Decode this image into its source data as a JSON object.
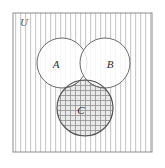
{
  "figure": {
    "type": "venn-diagram",
    "title": "",
    "universe": {
      "label": "U",
      "label_x": 20,
      "label_y": 26,
      "rect": {
        "x": 13,
        "y": 13,
        "width": 139,
        "height": 139
      },
      "border_color": "#8c8c8c",
      "fill_pattern": "vertical-hatch",
      "fill_color": "#ffffff",
      "hatch_color": "#c9c9c9",
      "hatch_spacing": 5
    },
    "sets": [
      {
        "name": "A",
        "label": "A",
        "cx": 62,
        "cy": 63,
        "r": 25,
        "label_x": 56,
        "label_y": 68,
        "stroke": "#6b6b6b",
        "fill": "#ffffff",
        "shaded": false
      },
      {
        "name": "B",
        "label": "B",
        "cx": 105,
        "cy": 63,
        "r": 25,
        "label_x": 110,
        "label_y": 68,
        "stroke": "#6b6b6b",
        "fill": "#ffffff",
        "shaded": false
      },
      {
        "name": "C",
        "label": "C",
        "cx": 85,
        "cy": 108,
        "r": 28,
        "label_x": 81,
        "label_y": 114,
        "stroke": "#555555",
        "fill": "#e8e8e8",
        "shaded": true,
        "shade_pattern": "cross-hatch-grid",
        "shade_color": "#8f8f8f",
        "shade_spacing": 5
      }
    ],
    "colors": {
      "background": "#ffffff",
      "outer_border": "#8c8c8c",
      "circle_stroke": "#6b6b6b",
      "shaded_stroke": "#555555",
      "label_text": "#2b2b2b",
      "universe_text": "#555555",
      "hatch": "#c9c9c9",
      "grid": "#8f8f8f"
    }
  }
}
